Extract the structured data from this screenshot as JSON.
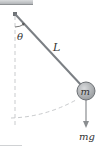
{
  "diagram": {
    "labels": {
      "angle": "θ",
      "length": "L",
      "mass": "m",
      "force": "mg"
    },
    "colors": {
      "ceiling": "#b9bcbf",
      "rod": "#7b7f84",
      "bob_fill": "#a9acaf",
      "bob_stroke": "#6d7175",
      "dashed": "#c4c6c8",
      "arrow": "#8a8d90",
      "text": "#333333"
    }
  }
}
